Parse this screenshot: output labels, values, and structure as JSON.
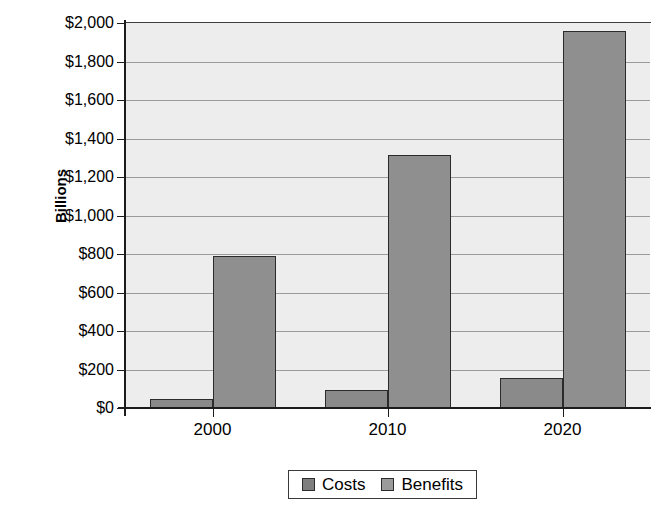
{
  "chart_data": {
    "type": "bar",
    "title": "",
    "xlabel": "",
    "ylabel": "Billions",
    "categories": [
      "2000",
      "2010",
      "2020"
    ],
    "series": [
      {
        "name": "Costs",
        "values": [
          47,
          93,
          156
        ],
        "color": "#8a8a8a"
      },
      {
        "name": "Benefits",
        "values": [
          790,
          1314,
          1958
        ],
        "color": "#8f8f8f"
      }
    ],
    "ylim": [
      0,
      2000
    ],
    "ytick_values": [
      0,
      200,
      400,
      600,
      800,
      1000,
      1200,
      1400,
      1600,
      1800,
      2000
    ],
    "ytick_labels": [
      "$2,000",
      "$1,800",
      "$1,600",
      "$1,400",
      "$1,200",
      "$1,000",
      "$800",
      "$600",
      "$400",
      "$200",
      "$0"
    ],
    "grid": true,
    "grid_axis": "y",
    "legend_position": "bottom",
    "plot_background": "#ededed",
    "figure_background": "#ffffff"
  },
  "legend": {
    "entries": [
      {
        "label": "Costs"
      },
      {
        "label": "Benefits"
      }
    ]
  }
}
